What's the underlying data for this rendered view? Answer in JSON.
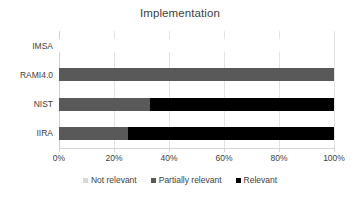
{
  "chart_data": {
    "type": "bar",
    "subtype": "stacked-horizontal-100",
    "title": "Implementation",
    "xlabel": "",
    "ylabel": "",
    "categories": [
      "IMSA",
      "RAMI4.0",
      "NIST",
      "IIRA"
    ],
    "series": [
      {
        "name": "Not relevant",
        "color": "#D9D9D9",
        "values": [
          100,
          0,
          0,
          0
        ]
      },
      {
        "name": "Partially relevant",
        "color": "#595959",
        "values": [
          0,
          100,
          33,
          25
        ]
      },
      {
        "name": "Relevant",
        "color": "#000000",
        "values": [
          0,
          0,
          67,
          75
        ]
      }
    ],
    "xlim": [
      0,
      100
    ],
    "xticks": [
      0,
      20,
      40,
      60,
      80,
      100
    ],
    "xtick_labels": [
      "0%",
      "20%",
      "40%",
      "60%",
      "80%",
      "100%"
    ],
    "grid": true,
    "legend_position": "bottom",
    "value_unit": "%"
  },
  "legend": {
    "items": [
      {
        "label": "Not relevant"
      },
      {
        "label": "Partially relevant"
      },
      {
        "label": "Relevant"
      }
    ]
  },
  "colors": {
    "not_relevant": "#D9D9D9",
    "partially_relevant": "#595959",
    "relevant": "#000000",
    "gridline": "#E3E3E3",
    "text": "#404040",
    "background": "#FFFFFF"
  }
}
